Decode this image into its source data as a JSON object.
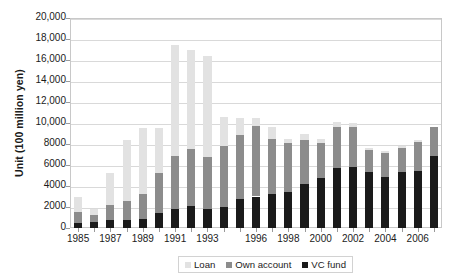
{
  "chart_data": {
    "type": "bar",
    "stacked": true,
    "title": "",
    "xlabel": "",
    "ylabel": "Unit (100 million yen)",
    "ylim": [
      0,
      20000
    ],
    "ytick_step": 2000,
    "ytick_labels": [
      "20,000",
      "18,000",
      "16,000",
      "14,000",
      "12,000",
      "10,000",
      "8000",
      "6000",
      "4000",
      "2000",
      "0"
    ],
    "grid": true,
    "legend_position": "bottom",
    "categories": [
      "1985",
      "1986",
      "1987",
      "1988",
      "1989",
      "1990",
      "1991",
      "1992",
      "1993",
      "1994",
      "1995",
      "1996",
      "1997",
      "1998",
      "1999",
      "2000",
      "2001",
      "2002",
      "2003",
      "2004",
      "2005",
      "2006",
      "2007"
    ],
    "xtick_labels_shown": [
      "1985",
      "1987",
      "1989",
      "1991",
      "1993",
      "1996",
      "1998",
      "2000",
      "2002",
      "2004",
      "2006"
    ],
    "series": [
      {
        "name": "VC fund",
        "color": "#1a1a1a",
        "values": [
          500,
          600,
          800,
          800,
          900,
          1400,
          1800,
          2100,
          1800,
          2000,
          2800,
          3000,
          3200,
          3400,
          4200,
          4800,
          5700,
          5800,
          5300,
          4900,
          5300,
          5400,
          6900
        ]
      },
      {
        "name": "Own account",
        "color": "#8c8c8c",
        "values": [
          1000,
          650,
          1400,
          1750,
          2300,
          3800,
          5100,
          5400,
          5000,
          5800,
          6100,
          6700,
          5300,
          4700,
          4200,
          3300,
          3900,
          3800,
          2100,
          2200,
          2300,
          2800,
          2700
        ]
      },
      {
        "name": "Loan",
        "color": "#e2e2e2",
        "values": [
          1500,
          550,
          3000,
          5800,
          6300,
          4300,
          10500,
          9500,
          9600,
          2800,
          1600,
          800,
          1100,
          400,
          600,
          400,
          500,
          400,
          200,
          200,
          200,
          200,
          0
        ]
      }
    ],
    "totals": [
      3000,
      1800,
      5200,
      8350,
      9500,
      9500,
      17400,
      17000,
      16400,
      10600,
      10500,
      10500,
      9600,
      8500,
      9000,
      8500,
      10100,
      10000,
      7600,
      7300,
      7800,
      8400,
      9600
    ]
  },
  "legend": {
    "items": [
      {
        "label": "Loan",
        "color": "#e2e2e2"
      },
      {
        "label": "Own account",
        "color": "#8c8c8c"
      },
      {
        "label": "VC fund",
        "color": "#1a1a1a"
      }
    ]
  },
  "axis": {
    "y_title": "Unit (100 million yen)"
  }
}
